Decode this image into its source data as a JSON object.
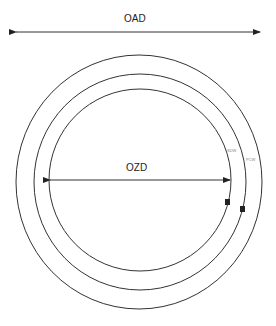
{
  "diagram": {
    "labels": {
      "outer_dimension": "OAD",
      "inner_dimension": "OZD",
      "ring_label_1": "SDW",
      "ring_label_2": "PCW",
      "marker_1": "B",
      "marker_2": "B"
    },
    "colors": {
      "stroke": "#222222",
      "background": "#ffffff"
    }
  }
}
